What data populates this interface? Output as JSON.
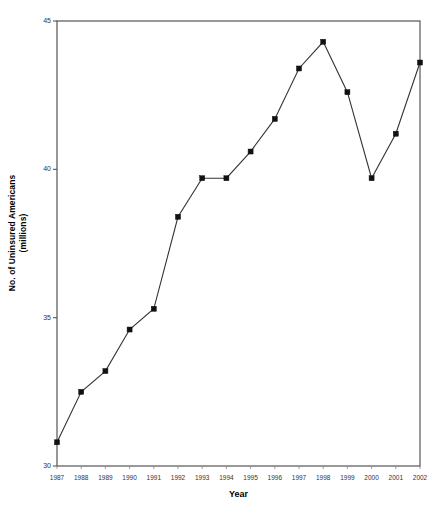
{
  "chart_data": {
    "type": "line",
    "title": "",
    "xlabel": "Year",
    "ylabel": "No. of Uninsured Americans (millions)",
    "ylabel_line1": "No. of Uninsured Americans",
    "ylabel_line2": "(millions)",
    "categories": [
      "1987",
      "1988",
      "1989",
      "1990",
      "1991",
      "1992",
      "1993",
      "1994",
      "1995",
      "1996",
      "1997",
      "1998",
      "1999",
      "2000",
      "2001",
      "2002"
    ],
    "values": [
      30.8,
      32.5,
      33.2,
      34.6,
      35.3,
      38.4,
      39.7,
      39.7,
      40.6,
      41.7,
      43.4,
      44.3,
      42.6,
      39.7,
      41.2,
      43.6
    ],
    "x": [
      1987,
      1988,
      1989,
      1990,
      1991,
      1992,
      1993,
      1994,
      1995,
      1996,
      1997,
      1998,
      1999,
      2000,
      2001,
      2002
    ],
    "ylim": [
      30,
      45
    ],
    "xlim": [
      1987,
      2002
    ],
    "yticks": [
      "30",
      "35",
      "40",
      "45"
    ],
    "ytick_values": [
      30,
      35,
      40,
      45
    ],
    "grid": false,
    "legend": null,
    "marker": "square",
    "line_color": "#333333",
    "marker_color": "#111111",
    "axis_color": "#555555",
    "background": "#ffffff"
  }
}
